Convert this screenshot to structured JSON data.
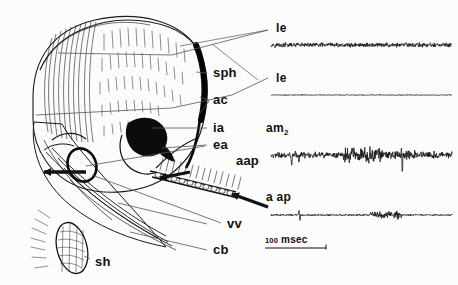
{
  "figure": {
    "background_color": "#fcfcfc",
    "ink_color": "#111111",
    "leader_color": "#555555"
  },
  "drawing": {
    "name": "abdomen-lateral-drawing",
    "labels": [
      {
        "id": "sph",
        "text": "sph",
        "x": 213,
        "y": 73,
        "meaning": "sphincter"
      },
      {
        "id": "ac",
        "text": "ac",
        "x": 213,
        "y": 100,
        "meaning": "anterior connective"
      },
      {
        "id": "ia",
        "text": "ia",
        "x": 213,
        "y": 128,
        "meaning": "internal apodeme"
      },
      {
        "id": "ea",
        "text": "ea",
        "x": 213,
        "y": 145,
        "meaning": "external apodeme"
      },
      {
        "id": "aap",
        "text": "aap",
        "x": 236,
        "y": 160,
        "meaning": "accessory abdominal process"
      },
      {
        "id": "vv",
        "text": "vv",
        "x": 227,
        "y": 224,
        "meaning": "ventral vein"
      },
      {
        "id": "cb",
        "text": "cb",
        "x": 213,
        "y": 250,
        "meaning": "costal brace"
      },
      {
        "id": "sh",
        "text": "sh",
        "x": 95,
        "y": 262,
        "meaning": "scaled hair plate"
      }
    ]
  },
  "traces": {
    "name": "emg-trace-panel",
    "items": [
      {
        "id": "le-1",
        "label": "le",
        "label_x": 276,
        "label_y": 28,
        "baseline_y": 45,
        "x0": 271,
        "x1": 452,
        "amplitude": 2.6,
        "description": "continuous low-amplitude tonic activity"
      },
      {
        "id": "le-2",
        "label": "le",
        "label_x": 276,
        "label_y": 78,
        "baseline_y": 95,
        "x0": 271,
        "x1": 452,
        "amplitude": 1.1,
        "description": "near-silent trace with small ripples"
      },
      {
        "id": "am2",
        "label": "am",
        "label_sub": "2",
        "label_x": 266,
        "label_y": 129,
        "baseline_y": 155,
        "x0": 271,
        "x1": 452,
        "amplitude": 9.0,
        "description": "large bursts with two prominent spikes"
      },
      {
        "id": "aap-t",
        "label": "a ap",
        "label_x": 266,
        "label_y": 198,
        "baseline_y": 215,
        "x0": 271,
        "x1": 452,
        "amplitude": 4.5,
        "description": "one sharp spike and a mid-record burst"
      }
    ],
    "scale_bar": {
      "value": "100",
      "unit": "msec",
      "text": "100 msec",
      "x": 265,
      "y": 242,
      "bar_x0": 265,
      "bar_x1": 326,
      "bar_y": 248
    }
  },
  "leaders": {
    "name": "leader-lines",
    "description": "thin grey lines connecting anatomical structures to labels and to trace labels"
  }
}
